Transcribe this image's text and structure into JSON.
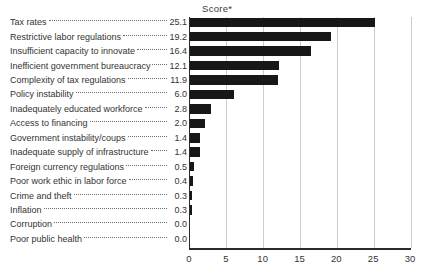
{
  "chart_data": {
    "type": "bar",
    "orientation": "horizontal",
    "title": "Score*",
    "categories": [
      "Tax rates",
      "Restrictive labor regulations",
      "Insufficient capacity to innovate",
      "Inefficient government bureaucracy",
      "Complexity of tax regulations",
      "Policy instability",
      "Inadequately educated workforce",
      "Access to financing",
      "Government instability/coups",
      "Inadequate supply of infrastructure",
      "Foreign currency regulations",
      "Poor work ethic in labor force",
      "Crime and theft",
      "Inflation",
      "Corruption",
      "Poor public health"
    ],
    "values": [
      25.1,
      19.2,
      16.4,
      12.1,
      11.9,
      6.0,
      2.8,
      2.0,
      1.4,
      1.4,
      0.5,
      0.4,
      0.3,
      0.3,
      0.0,
      0.0
    ],
    "value_labels": [
      "25.1",
      "19.2",
      "16.4",
      "12.1",
      "11.9",
      "6.0",
      "2.8",
      "2.0",
      "1.4",
      "1.4",
      "0.5",
      "0.4",
      "0.3",
      "0.3",
      "0.0",
      "0.0"
    ],
    "xlabel": "",
    "ylabel": "",
    "xlim": [
      0,
      30
    ],
    "x_ticks": [
      0,
      5,
      10,
      15,
      20,
      25,
      30
    ],
    "x_tick_labels": [
      "0",
      "5",
      "10",
      "15",
      "20",
      "25",
      "30"
    ],
    "grid": "vertical",
    "legend": "none",
    "bar_color": "#171717",
    "gridline_color": "#cccccc",
    "axis_color": "#2a2a2a",
    "text_color": "#333333"
  }
}
